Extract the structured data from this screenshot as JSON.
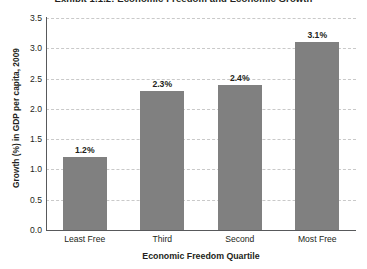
{
  "chart_data": {
    "type": "bar",
    "title": "Exhibit 1.1.2: Economic Freedom and Economic Growth",
    "xlabel": "Economic Freedom Quartile",
    "ylabel": "Growth (%) in GDP per capita, 2009",
    "categories": [
      "Least Free",
      "Third",
      "Second",
      "Most Free"
    ],
    "values": [
      1.2,
      2.3,
      2.4,
      3.1
    ],
    "data_labels": [
      "1.2%",
      "2.3%",
      "2.4%",
      "3.1%"
    ],
    "ylim": [
      0.0,
      3.5
    ],
    "ytick_labels": [
      "0.0",
      "0.5",
      "1.0",
      "1.5",
      "2.0",
      "2.5",
      "3.0",
      "3.5"
    ],
    "ytick_values": [
      0.0,
      0.5,
      1.0,
      1.5,
      2.0,
      2.5,
      3.0,
      3.5
    ],
    "grid": "horizontal-dashed",
    "legend": "none",
    "bar_color": "#808080",
    "gridline_color": "#c9c9c9",
    "axis_color": "#58595b",
    "text_color": "#231f20",
    "background_color": "#ffffff"
  }
}
